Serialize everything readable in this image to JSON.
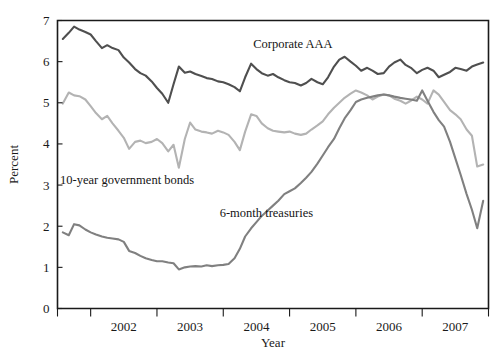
{
  "chart_data": {
    "type": "line",
    "title": "",
    "xlabel": "Year",
    "ylabel": "Percent",
    "xlim": [
      2001.5,
      2008.0
    ],
    "ylim": [
      0,
      7
    ],
    "grid": false,
    "legend_position": "inline-annotations",
    "y_ticks": [
      0,
      1,
      2,
      3,
      4,
      5,
      6,
      7
    ],
    "y_tick_labels": [
      "0",
      "1",
      "2",
      "3",
      "4",
      "5",
      "6",
      "7"
    ],
    "x_ticks": [
      2002.0,
      2003.0,
      2004.0,
      2005.0,
      2006.0,
      2007.0,
      2008.0
    ],
    "x_tick_labels": [
      "2002",
      "2003",
      "2004",
      "2005",
      "2006",
      "2007"
    ],
    "x_tick_label_positions": [
      2002.5,
      2003.5,
      2004.5,
      2005.5,
      2006.5,
      2007.5
    ],
    "annotations": [
      {
        "text": "Corporate AAA",
        "x": 2005.05,
        "y": 6.32
      },
      {
        "text": "10-year government bonds",
        "x": 2002.55,
        "y": 3.02
      },
      {
        "text": "6-month treasuries",
        "x": 2004.65,
        "y": 2.22
      }
    ],
    "series": [
      {
        "name": "Corporate AAA",
        "color": "#4f4f4f",
        "width": 2.1,
        "x": [
          2001.58,
          2001.67,
          2001.75,
          2001.83,
          2001.92,
          2002.0,
          2002.08,
          2002.17,
          2002.25,
          2002.33,
          2002.42,
          2002.5,
          2002.58,
          2002.67,
          2002.75,
          2002.83,
          2002.92,
          2003.0,
          2003.08,
          2003.17,
          2003.25,
          2003.33,
          2003.42,
          2003.5,
          2003.58,
          2003.67,
          2003.75,
          2003.83,
          2003.92,
          2004.0,
          2004.08,
          2004.17,
          2004.25,
          2004.33,
          2004.42,
          2004.5,
          2004.58,
          2004.67,
          2004.75,
          2004.83,
          2004.92,
          2005.0,
          2005.08,
          2005.17,
          2005.25,
          2005.33,
          2005.42,
          2005.5,
          2005.58,
          2005.67,
          2005.75,
          2005.83,
          2005.92,
          2006.0,
          2006.08,
          2006.17,
          2006.25,
          2006.33,
          2006.42,
          2006.5,
          2006.58,
          2006.67,
          2006.75,
          2006.83,
          2006.92,
          2007.0,
          2007.08,
          2007.17,
          2007.25,
          2007.33,
          2007.42,
          2007.5,
          2007.58,
          2007.67,
          2007.75,
          2007.83,
          2007.92
        ],
        "y": [
          6.55,
          6.7,
          6.85,
          6.78,
          6.72,
          6.66,
          6.5,
          6.33,
          6.4,
          6.33,
          6.28,
          6.1,
          5.98,
          5.82,
          5.72,
          5.66,
          5.52,
          5.36,
          5.22,
          5.0,
          5.45,
          5.88,
          5.73,
          5.76,
          5.7,
          5.65,
          5.6,
          5.58,
          5.52,
          5.5,
          5.45,
          5.38,
          5.28,
          5.62,
          5.95,
          5.82,
          5.72,
          5.66,
          5.7,
          5.62,
          5.55,
          5.5,
          5.48,
          5.42,
          5.48,
          5.58,
          5.5,
          5.45,
          5.62,
          5.88,
          6.05,
          6.12,
          6.0,
          5.9,
          5.78,
          5.85,
          5.78,
          5.7,
          5.72,
          5.88,
          5.98,
          6.05,
          5.92,
          5.85,
          5.72,
          5.8,
          5.85,
          5.78,
          5.62,
          5.68,
          5.75,
          5.85,
          5.82,
          5.78,
          5.88,
          5.93,
          5.98
        ]
      },
      {
        "name": "10-year government bonds",
        "color": "#b3b3b3",
        "width": 2.1,
        "x": [
          2001.58,
          2001.67,
          2001.75,
          2001.83,
          2001.92,
          2002.0,
          2002.08,
          2002.17,
          2002.25,
          2002.33,
          2002.42,
          2002.5,
          2002.58,
          2002.67,
          2002.75,
          2002.83,
          2002.92,
          2003.0,
          2003.08,
          2003.17,
          2003.25,
          2003.33,
          2003.42,
          2003.5,
          2003.58,
          2003.67,
          2003.75,
          2003.83,
          2003.92,
          2004.0,
          2004.08,
          2004.17,
          2004.25,
          2004.33,
          2004.42,
          2004.5,
          2004.58,
          2004.67,
          2004.75,
          2004.83,
          2004.92,
          2005.0,
          2005.08,
          2005.17,
          2005.25,
          2005.33,
          2005.42,
          2005.5,
          2005.58,
          2005.67,
          2005.75,
          2005.83,
          2005.92,
          2006.0,
          2006.08,
          2006.17,
          2006.25,
          2006.33,
          2006.42,
          2006.5,
          2006.58,
          2006.67,
          2006.75,
          2006.83,
          2006.92,
          2007.0,
          2007.08,
          2007.17,
          2007.25,
          2007.33,
          2007.42,
          2007.5,
          2007.58,
          2007.67,
          2007.75,
          2007.83,
          2007.92
        ],
        "y": [
          4.98,
          5.25,
          5.18,
          5.16,
          5.08,
          4.92,
          4.75,
          4.6,
          4.68,
          4.5,
          4.32,
          4.15,
          3.88,
          4.05,
          4.08,
          4.02,
          4.05,
          4.12,
          4.02,
          3.82,
          3.98,
          3.42,
          4.12,
          4.52,
          4.35,
          4.3,
          4.28,
          4.25,
          4.32,
          4.28,
          4.22,
          4.05,
          3.85,
          4.3,
          4.72,
          4.68,
          4.5,
          4.38,
          4.32,
          4.3,
          4.28,
          4.3,
          4.25,
          4.22,
          4.25,
          4.35,
          4.45,
          4.55,
          4.72,
          4.88,
          5.0,
          5.12,
          5.22,
          5.3,
          5.25,
          5.18,
          5.08,
          5.15,
          5.2,
          5.18,
          5.1,
          5.05,
          4.98,
          5.05,
          5.15,
          5.08,
          4.98,
          5.3,
          5.2,
          5.02,
          4.82,
          4.72,
          4.6,
          4.35,
          4.2,
          3.45,
          3.5
        ]
      },
      {
        "name": "6-month treasuries",
        "color": "#808080",
        "width": 2.1,
        "x": [
          2001.58,
          2001.67,
          2001.75,
          2001.83,
          2001.92,
          2002.0,
          2002.08,
          2002.17,
          2002.25,
          2002.33,
          2002.42,
          2002.5,
          2002.58,
          2002.67,
          2002.75,
          2002.83,
          2002.92,
          2003.0,
          2003.08,
          2003.17,
          2003.25,
          2003.33,
          2003.42,
          2003.5,
          2003.58,
          2003.67,
          2003.75,
          2003.83,
          2003.92,
          2004.0,
          2004.08,
          2004.17,
          2004.25,
          2004.33,
          2004.42,
          2004.5,
          2004.58,
          2004.67,
          2004.75,
          2004.83,
          2004.92,
          2005.0,
          2005.08,
          2005.17,
          2005.25,
          2005.33,
          2005.42,
          2005.5,
          2005.58,
          2005.67,
          2005.75,
          2005.83,
          2005.92,
          2006.0,
          2006.08,
          2006.17,
          2006.25,
          2006.33,
          2006.42,
          2006.5,
          2006.58,
          2006.67,
          2006.75,
          2006.83,
          2006.92,
          2007.0,
          2007.08,
          2007.17,
          2007.25,
          2007.33,
          2007.42,
          2007.5,
          2007.58,
          2007.67,
          2007.75,
          2007.83,
          2007.92
        ],
        "y": [
          1.85,
          1.78,
          2.05,
          2.02,
          1.92,
          1.85,
          1.8,
          1.75,
          1.72,
          1.7,
          1.68,
          1.62,
          1.4,
          1.35,
          1.28,
          1.22,
          1.18,
          1.15,
          1.15,
          1.12,
          1.1,
          0.95,
          1.0,
          1.02,
          1.03,
          1.02,
          1.05,
          1.03,
          1.05,
          1.06,
          1.08,
          1.22,
          1.45,
          1.75,
          1.95,
          2.1,
          2.25,
          2.38,
          2.5,
          2.62,
          2.78,
          2.85,
          2.92,
          3.05,
          3.18,
          3.32,
          3.52,
          3.72,
          3.92,
          4.12,
          4.38,
          4.62,
          4.82,
          5.02,
          5.08,
          5.12,
          5.15,
          5.18,
          5.2,
          5.18,
          5.15,
          5.12,
          5.1,
          5.08,
          5.05,
          5.3,
          5.05,
          4.78,
          4.58,
          4.42,
          4.05,
          3.65,
          3.25,
          2.78,
          2.4,
          1.95,
          2.62
        ]
      }
    ]
  }
}
